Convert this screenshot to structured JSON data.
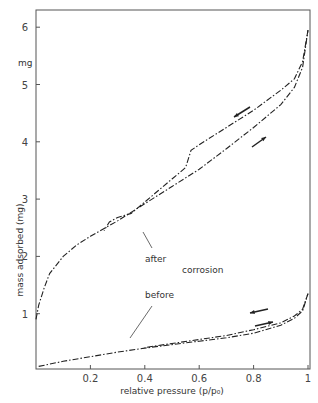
{
  "chart_data": {
    "type": "line",
    "title": "",
    "xlabel": "relative pressure (p/p₀)",
    "ylabel": "mass adsorbed (mg)",
    "y_unit_label": "mg",
    "xlim": [
      0,
      1
    ],
    "ylim": [
      0.04,
      6.4
    ],
    "x_ticks": [
      0.2,
      0.4,
      0.6,
      0.8,
      1
    ],
    "x_tick_labels": [
      "0.2",
      "0.4",
      "0.6",
      "0.8",
      "1"
    ],
    "y_ticks": [
      1,
      2,
      3,
      4,
      5,
      6
    ],
    "y_tick_labels": [
      "1",
      "2",
      "3",
      "4",
      "5",
      "6"
    ],
    "grid": false,
    "legend": null,
    "annotations": [
      {
        "text": "after",
        "x": 0.43,
        "y": 2.05
      },
      {
        "text": "corrosion",
        "x": 0.6,
        "y": 1.7
      },
      {
        "text": "before",
        "x": 0.43,
        "y": 1.3
      }
    ],
    "series": [
      {
        "name": "after - adsorption",
        "style": "dash-dot",
        "x": [
          0.0,
          0.01,
          0.03,
          0.05,
          0.1,
          0.15,
          0.2,
          0.3,
          0.4,
          0.5,
          0.6,
          0.7,
          0.8,
          0.9,
          0.95,
          0.98,
          1.0
        ],
        "y": [
          0.9,
          1.15,
          1.45,
          1.7,
          2.0,
          2.2,
          2.35,
          2.62,
          2.92,
          3.22,
          3.52,
          3.88,
          4.25,
          4.65,
          4.95,
          5.3,
          5.95
        ]
      },
      {
        "name": "after - desorption",
        "style": "dash-dot",
        "x": [
          1.0,
          0.98,
          0.95,
          0.9,
          0.8,
          0.7,
          0.6,
          0.57,
          0.55,
          0.5,
          0.45,
          0.4,
          0.35,
          0.3,
          0.27,
          0.25
        ],
        "y": [
          5.95,
          5.4,
          5.1,
          4.9,
          4.55,
          4.25,
          3.95,
          3.85,
          3.55,
          3.35,
          3.15,
          2.95,
          2.75,
          2.68,
          2.6,
          2.45
        ]
      },
      {
        "name": "before - adsorption",
        "style": "dash-dot",
        "x": [
          0.01,
          0.1,
          0.2,
          0.3,
          0.4,
          0.5,
          0.6,
          0.7,
          0.8,
          0.9,
          0.95,
          0.98,
          1.0
        ],
        "y": [
          0.08,
          0.17,
          0.25,
          0.33,
          0.4,
          0.46,
          0.52,
          0.58,
          0.66,
          0.8,
          0.92,
          1.05,
          1.35
        ]
      },
      {
        "name": "before - desorption",
        "style": "dash-dot",
        "x": [
          1.0,
          0.98,
          0.95,
          0.9,
          0.8,
          0.7,
          0.6,
          0.5,
          0.4
        ],
        "y": [
          1.35,
          1.08,
          0.96,
          0.84,
          0.72,
          0.62,
          0.55,
          0.48,
          0.41
        ]
      }
    ]
  }
}
